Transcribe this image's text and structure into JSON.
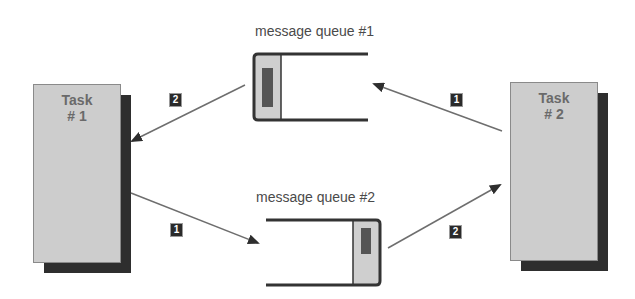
{
  "diagram": {
    "type": "message-queue-communication",
    "colors": {
      "task_fill": "#cdcdcd",
      "task_shadow": "#2e2e2e",
      "queue_outline": "#333333",
      "queue_slot_fill": "#cfcfcf",
      "queue_message_fill": "#555555",
      "arrow": "#6e6e6e",
      "badge_bg": "#2a2a2a",
      "badge_text": "#ffffff"
    },
    "tasks": [
      {
        "id": "task1",
        "title": "Task",
        "number": "# 1"
      },
      {
        "id": "task2",
        "title": "Task",
        "number": "# 2"
      }
    ],
    "queues": [
      {
        "id": "queue1",
        "label": "message queue  #1"
      },
      {
        "id": "queue2",
        "label": "message queue  #2"
      }
    ],
    "arrows": [
      {
        "from": "queue1",
        "to": "task1",
        "step": "2"
      },
      {
        "from": "task1",
        "to": "queue2",
        "step": "1"
      },
      {
        "from": "task2",
        "to": "queue1",
        "step": "1"
      },
      {
        "from": "queue2",
        "to": "task2",
        "step": "2"
      }
    ]
  }
}
